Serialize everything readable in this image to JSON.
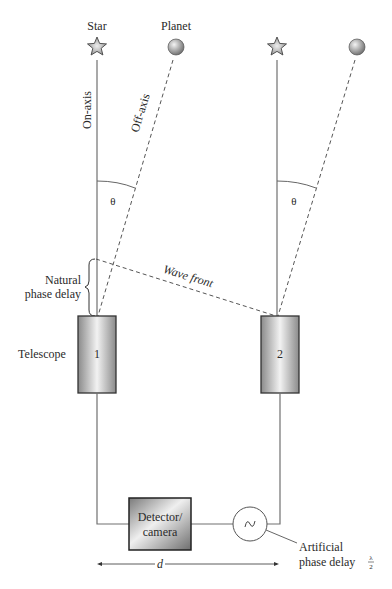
{
  "diagram": {
    "type": "interferometer-schematic",
    "labels": {
      "star": "Star",
      "planet": "Planet",
      "on_axis": "On-axis",
      "off_axis": "Off-axis",
      "theta_left": "θ",
      "theta_right": "θ",
      "wave_front": "Wave front",
      "natural_phase_delay_line1": "Natural",
      "natural_phase_delay_line2": "phase delay",
      "telescope": "Telescope",
      "telescope_1": "1",
      "telescope_2": "2",
      "detector_line1": "Detector/",
      "detector_line2": "camera",
      "delay_symbol": "~",
      "artificial_line1": "Artificial",
      "artificial_line2": "phase delay",
      "lambda": "λ",
      "two": "2",
      "baseline": "d"
    },
    "colors": {
      "line": "#707070",
      "dash": "#555555",
      "telescope_edge": "#333333",
      "text": "#2a2a2a"
    }
  }
}
